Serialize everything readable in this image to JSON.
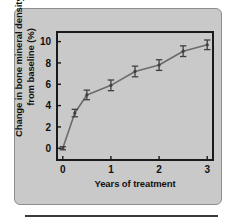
{
  "figure": {
    "panel_bg_color": "#c9c9c9",
    "panel_border_color": "#8e8e8e",
    "page_bg_color": "#ffffff",
    "axis_color": "#1a1a1a",
    "series_color": "#6b6b6b",
    "marker_color": "#3f3f3f"
  },
  "chart_data": {
    "type": "line",
    "title": "",
    "subtitle": "",
    "xlabel": "Years of treatment",
    "ylabel": "Change in bone mineral density from baseline (%)",
    "ylabel_line1": "Change in bone mineral density",
    "ylabel_line2": "from baseline (%)",
    "xlim": [
      -0.12,
      3.12
    ],
    "ylim": [
      -1.1,
      10.9
    ],
    "xticks": [
      0,
      1,
      2,
      3
    ],
    "xtick_labels": [
      "0",
      "1",
      "2",
      "3"
    ],
    "yticks": [
      0,
      2,
      4,
      6,
      8,
      10
    ],
    "ytick_labels": [
      "0",
      "2",
      "4",
      "6",
      "8",
      "10"
    ],
    "grid": false,
    "legend": "none",
    "x": [
      0,
      0.25,
      0.5,
      1.0,
      1.5,
      2.0,
      2.5,
      3.0
    ],
    "values": [
      0.0,
      3.3,
      5.0,
      5.9,
      7.2,
      7.8,
      9.1,
      9.7
    ],
    "error_bars": [
      0.15,
      0.35,
      0.45,
      0.5,
      0.5,
      0.5,
      0.5,
      0.45
    ],
    "series": [
      {
        "name": "Change in bone mineral density",
        "values": [
          0.0,
          3.3,
          5.0,
          5.9,
          7.2,
          7.8,
          9.1,
          9.7
        ]
      }
    ],
    "marker": "error-bar-cap",
    "line_style": "solid"
  }
}
